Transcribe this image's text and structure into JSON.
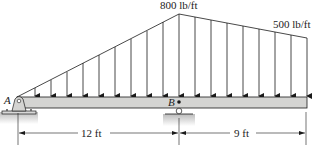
{
  "diagram": {
    "load_peak_label": "800 lb/ft",
    "load_end_label": "500 lb/ft",
    "support_a_label": "A",
    "support_b_label": "B",
    "span_ab_label": "12 ft",
    "span_bc_label": "9 ft"
  },
  "colors": {
    "beam_fill": "#d4d4d2",
    "line": "#1a1a1a",
    "ground": "#bdbdbd"
  }
}
